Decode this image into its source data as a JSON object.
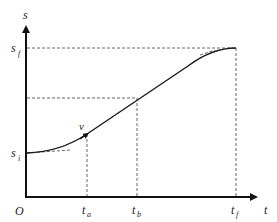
{
  "diagram": {
    "type": "position-time trajectory (trapezoidal velocity profile)",
    "axes": {
      "y_label": "s",
      "x_label": "t",
      "origin_label": "O"
    },
    "y_ticks": [
      {
        "base": "s",
        "sub": "f",
        "y": 48
      },
      {
        "base": "s",
        "sub": "i",
        "y": 153
      }
    ],
    "x_ticks": [
      {
        "base": "t",
        "sub": "a",
        "x": 87
      },
      {
        "base": "t",
        "sub": "b",
        "x": 137
      },
      {
        "base": "t",
        "sub": "f",
        "x": 236
      }
    ],
    "point_label": "v",
    "colors": {
      "axis": "#111111",
      "curve": "#1a1a1a",
      "dashed": "#555555"
    }
  }
}
